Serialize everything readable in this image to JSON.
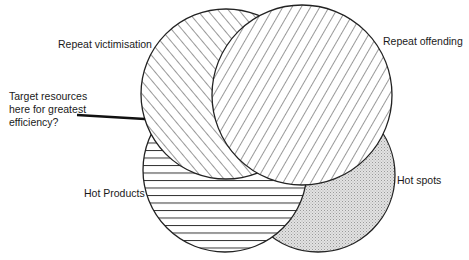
{
  "diagram": {
    "type": "venn",
    "sets": [
      {
        "id": "repeat-victimisation",
        "label": "Repeat victimisation",
        "pattern": "diagonal-hatch-up"
      },
      {
        "id": "repeat-offending",
        "label": "Repeat offending",
        "pattern": "diagonal-hatch-down"
      },
      {
        "id": "hot-products",
        "label": "Hot Products",
        "pattern": "horizontal-lines"
      },
      {
        "id": "hot-spots",
        "label": "Hot spots",
        "pattern": "stipple-gray"
      }
    ],
    "annotation": {
      "lines": [
        "Target resources",
        "here for greatest",
        "efficiency?"
      ]
    },
    "colors": {
      "stroke": "#222222",
      "stipple": "#c8c8c8",
      "background": "#ffffff"
    }
  }
}
